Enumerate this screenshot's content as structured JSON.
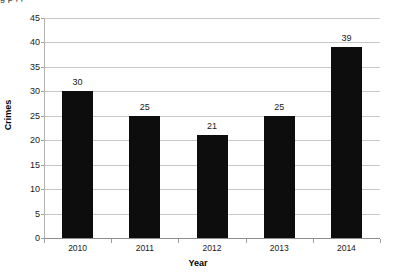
{
  "clipped_caption": "g                                         p                        ,           ,",
  "chart_data": {
    "type": "bar",
    "title": "",
    "categories": [
      "2010",
      "2011",
      "2012",
      "2013",
      "2014"
    ],
    "values": [
      30,
      25,
      21,
      25,
      39
    ],
    "value_labels": [
      "30",
      "25",
      "21",
      "25",
      "39"
    ],
    "xlabel": "Year",
    "ylabel": "Crimes",
    "ylim": [
      0,
      45
    ],
    "ytick_step": 5,
    "yticks": [
      45,
      40,
      35,
      30,
      25,
      20,
      15,
      10,
      5,
      0
    ],
    "ytick_labels": [
      "45",
      "40",
      "35",
      "30",
      "25",
      "20",
      "15",
      "10",
      "5",
      "0"
    ],
    "grid": "horizontal",
    "legend": "none",
    "bar_color": "#0d0d0d",
    "gridline_color": "#c8c8c8",
    "background_color": "#ffffff"
  }
}
